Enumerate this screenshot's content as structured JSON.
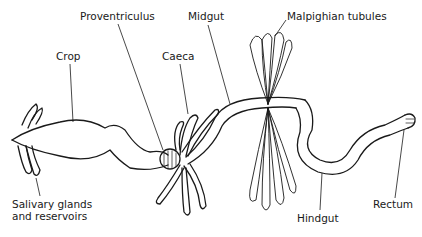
{
  "diagram": {
    "labels": {
      "proventriculus": "Proventriculus",
      "midgut": "Midgut",
      "malpighian_tubules": "Malpighian tubules",
      "crop": "Crop",
      "caeca": "Caeca",
      "salivary_line1": "Salivary glands",
      "salivary_line2": "and reservoirs",
      "hindgut": "Hindgut",
      "rectum": "Rectum"
    },
    "colors": {
      "ink": "#1a1a1a",
      "background": "#ffffff"
    }
  }
}
